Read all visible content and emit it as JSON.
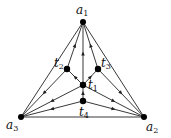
{
  "diagram": {
    "type": "directed-graph",
    "nodes": [
      {
        "id": "a1",
        "label": "a",
        "sub": "1",
        "x": 83,
        "y": 22,
        "lx": 76,
        "ly": 14
      },
      {
        "id": "a2",
        "label": "a",
        "sub": "2",
        "x": 144,
        "y": 117,
        "lx": 146,
        "ly": 131
      },
      {
        "id": "a3",
        "label": "a",
        "sub": "3",
        "x": 21,
        "y": 117,
        "lx": 6,
        "ly": 129
      },
      {
        "id": "t1",
        "label": "t",
        "sub": "1",
        "x": 83,
        "y": 85,
        "lx": 88,
        "ly": 89
      },
      {
        "id": "t2",
        "label": "t",
        "sub": "2",
        "x": 67,
        "y": 69,
        "lx": 54,
        "ly": 67
      },
      {
        "id": "t3",
        "label": "t",
        "sub": "3",
        "x": 98,
        "y": 69,
        "lx": 101,
        "ly": 67
      },
      {
        "id": "t4",
        "label": "t",
        "sub": "4",
        "x": 83,
        "y": 101,
        "lx": 79,
        "ly": 116
      }
    ],
    "edges": [
      {
        "from": "a1",
        "to": "a2",
        "arrow": false
      },
      {
        "from": "a1",
        "to": "a3",
        "arrow": false
      },
      {
        "from": "a3",
        "to": "a2",
        "arrow": false
      },
      {
        "from": "t2",
        "to": "a1",
        "arrow": true
      },
      {
        "from": "t3",
        "to": "a1",
        "arrow": true
      },
      {
        "from": "t1",
        "to": "a1",
        "arrow": true
      },
      {
        "from": "t2",
        "to": "a3",
        "arrow": true
      },
      {
        "from": "t1",
        "to": "t2",
        "arrow": true
      },
      {
        "from": "t1",
        "to": "t3",
        "arrow": true
      },
      {
        "from": "t3",
        "to": "a2",
        "arrow": true
      },
      {
        "from": "t1",
        "to": "a3",
        "arrow": true
      },
      {
        "from": "t1",
        "to": "a2",
        "arrow": true
      },
      {
        "from": "t4",
        "to": "t1",
        "arrow": true
      },
      {
        "from": "t4",
        "to": "a3",
        "arrow": true
      },
      {
        "from": "t4",
        "to": "a2",
        "arrow": true
      }
    ],
    "colors": {
      "line": "#222222",
      "node": "#000000"
    }
  }
}
